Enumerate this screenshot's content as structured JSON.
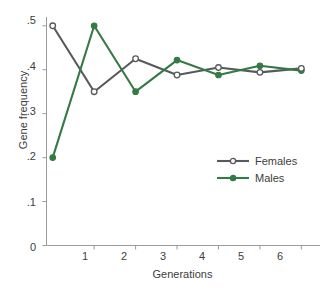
{
  "chart_data": {
    "type": "line",
    "title": "",
    "xlabel": "Generations",
    "ylabel": "Gene frequency",
    "x": [
      0,
      1,
      2,
      3,
      4,
      5,
      6
    ],
    "xlim": [
      -0.15,
      6.45
    ],
    "ylim": [
      0,
      0.52
    ],
    "xticks": [
      "1",
      "2",
      "3",
      "4",
      "5",
      "6"
    ],
    "xtick_values": [
      1,
      2,
      3,
      4,
      5,
      6
    ],
    "yticks": [
      "0",
      ".1",
      ".2",
      ".3",
      ".4",
      ".5"
    ],
    "ytick_values": [
      0,
      0.1,
      0.2,
      0.3,
      0.4,
      0.5
    ],
    "grid": false,
    "legend_position": "center-right",
    "series": [
      {
        "name": "Females",
        "color": "#58595b",
        "marker": "open-circle",
        "values": [
          0.5,
          0.35,
          0.425,
          0.388,
          0.405,
          0.394,
          0.403
        ]
      },
      {
        "name": "Males",
        "color": "#357a44",
        "marker": "filled-circle",
        "values": [
          0.2,
          0.5,
          0.35,
          0.422,
          0.388,
          0.409,
          0.398
        ]
      }
    ]
  },
  "axes": {
    "y_label": "Gene frequency",
    "x_label": "Generations",
    "y_tick_labels": [
      "0",
      ".1",
      ".2",
      ".3",
      ".4",
      ".5"
    ],
    "x_tick_labels": [
      "1",
      "2",
      "3",
      "4",
      "5",
      "6"
    ]
  },
  "legend": {
    "items": [
      {
        "label": "Females",
        "color": "#58595b",
        "marker": "open-circle"
      },
      {
        "label": "Males",
        "color": "#357a44",
        "marker": "filled-circle"
      }
    ]
  },
  "colors": {
    "females": "#58595b",
    "males": "#357a44",
    "axis": "#9a9a9a",
    "text": "#3d3d3d",
    "background": "#ffffff"
  }
}
